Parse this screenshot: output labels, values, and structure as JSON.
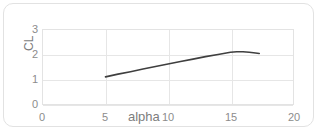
{
  "chart_data": {
    "type": "line",
    "title": "",
    "xlabel": "alpha",
    "ylabel": "CL",
    "xlim": [
      0,
      20
    ],
    "ylim": [
      0,
      3
    ],
    "xticks": [
      0,
      5,
      10,
      15,
      20
    ],
    "yticks": [
      0,
      1,
      2,
      3
    ],
    "grid": true,
    "legend": false,
    "series": [
      {
        "name": "CL",
        "color": "#3f3f3f",
        "x": [
          5.0,
          6.0,
          7.0,
          8.0,
          9.0,
          10.0,
          11.0,
          12.0,
          13.0,
          14.0,
          15.0,
          15.5,
          16.0,
          16.5,
          17.0,
          17.3
        ],
        "values": [
          1.1,
          1.21,
          1.31,
          1.42,
          1.52,
          1.62,
          1.72,
          1.82,
          1.92,
          2.01,
          2.1,
          2.12,
          2.12,
          2.1,
          2.07,
          2.05
        ]
      }
    ]
  },
  "axes": {
    "y_title": "CL",
    "x_title": "alpha",
    "y_tick_labels": [
      "3",
      "2",
      "1",
      "0"
    ],
    "x_tick_labels": [
      "0",
      "5",
      "10",
      "15",
      "20"
    ]
  },
  "style": {
    "frame_border_color": "#e2e2e2",
    "plot_border_color": "#e3e3e3",
    "gridline_color": "#e6e6e6",
    "tick_label_color": "#8c8c8c",
    "axis_title_color": "#7d7d7d",
    "series_color": "#3f3f3f",
    "background": "#ffffff"
  }
}
